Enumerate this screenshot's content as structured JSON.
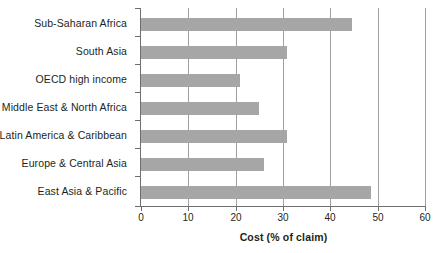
{
  "chart_data": {
    "type": "bar",
    "orientation": "horizontal",
    "title": "",
    "xlabel": "Cost (% of claim)",
    "ylabel": "",
    "xlim": [
      0,
      60
    ],
    "xticks": [
      0,
      10,
      20,
      30,
      40,
      50,
      60
    ],
    "xtick_labels": [
      "0",
      "10",
      "20",
      "30",
      "40",
      "50",
      "60"
    ],
    "grid": "vertical",
    "legend": "none",
    "bar_color": "#a6a6a6",
    "axis_color": "#6d6e71",
    "gridline_color": "#a0a0a0",
    "categories": [
      "Sub-Saharan Africa",
      "South Asia",
      "OECD high income",
      "Middle East & North Africa",
      "Latin America & Caribbean",
      "Europe & Central Asia",
      "East Asia & Pacific"
    ],
    "values": [
      44.6,
      30.8,
      20.9,
      24.9,
      30.9,
      26.0,
      48.6
    ]
  }
}
